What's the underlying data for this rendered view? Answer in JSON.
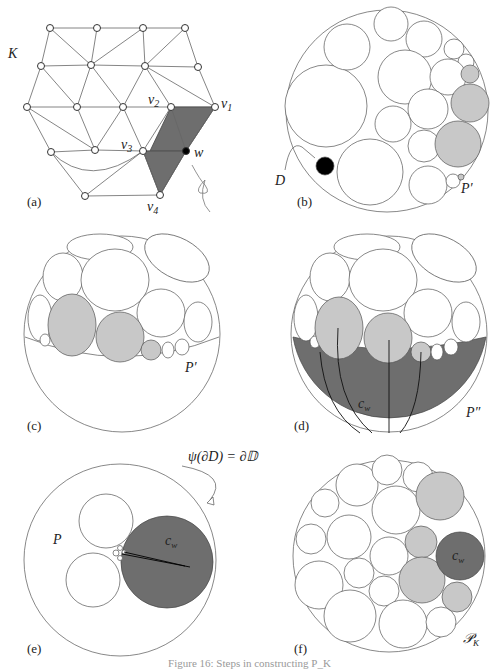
{
  "figure": {
    "caption": "Figure 16: Steps in constructing P_K",
    "colors": {
      "stroke": "#555555",
      "light_fill": "#c8c8c8",
      "dark_fill": "#6e6e6e",
      "black": "#000000"
    }
  },
  "panels": {
    "a": {
      "label": "(a)",
      "complex_label": "K",
      "vertex_labels": {
        "v1": "v",
        "v1_sub": "1",
        "v2": "v",
        "v2_sub": "2",
        "v3": "v",
        "v3_sub": "3",
        "v4": "v",
        "v4_sub": "4",
        "w": "w"
      }
    },
    "b": {
      "label": "(b)",
      "disk_label": "D",
      "packing_label": "P′"
    },
    "c": {
      "label": "(c)",
      "packing_label": "P′"
    },
    "d": {
      "label": "(d)",
      "packing_label": "P″",
      "circle_label": "c",
      "circle_sub": "w"
    },
    "e": {
      "label": "(e)",
      "packing_label": "P",
      "circle_label": "c",
      "circle_sub": "w",
      "boundary_annotation": "ψ(∂D) = ∂𝔻"
    },
    "f": {
      "label": "(f)",
      "packing_label": "𝒫",
      "packing_sub": "K",
      "circle_label": "c",
      "circle_sub": "w"
    }
  }
}
